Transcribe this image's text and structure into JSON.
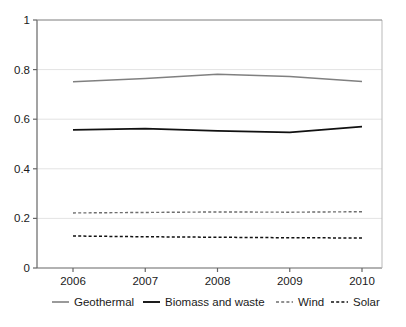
{
  "chart_data": {
    "type": "line",
    "title": "",
    "subtitle": "",
    "xlabel": "",
    "ylabel": "",
    "x": [
      2006,
      2007,
      2008,
      2009,
      2010
    ],
    "categories": [
      "2006",
      "2007",
      "2008",
      "2009",
      "2010"
    ],
    "xtick_labels": [
      "2006",
      "2007",
      "2008",
      "2009",
      "2010"
    ],
    "ytick_labels": [
      "0",
      "0.2",
      "0.4",
      "0.6",
      "0.8",
      "1"
    ],
    "ytick_values": [
      0,
      0.2,
      0.4,
      0.6,
      0.8,
      1
    ],
    "ylim": [
      0,
      1
    ],
    "xlim": [
      2006,
      2010
    ],
    "grid": "horizontal",
    "legend_position": "bottom",
    "series": [
      {
        "name": "Geothermal",
        "values": [
          0.751,
          0.764,
          0.781,
          0.772,
          0.752
        ],
        "color": "#808080",
        "style": "solid",
        "width": 1.4
      },
      {
        "name": "Biomass and waste",
        "values": [
          0.557,
          0.562,
          0.553,
          0.547,
          0.57
        ],
        "color": "#111111",
        "style": "solid",
        "width": 1.7
      },
      {
        "name": "Wind",
        "values": [
          0.222,
          0.224,
          0.226,
          0.225,
          0.227
        ],
        "color": "#6e6e6e",
        "style": "dashed",
        "width": 1.4
      },
      {
        "name": "Solar",
        "values": [
          0.129,
          0.126,
          0.124,
          0.122,
          0.121
        ],
        "color": "#111111",
        "style": "dashed",
        "width": 1.5
      }
    ]
  },
  "axes": {
    "y_axis_name": "value-axis",
    "x_axis_name": "year-axis"
  },
  "legend": {
    "entries": [
      {
        "label": "Geothermal",
        "swatch": "solid-gray"
      },
      {
        "label": "Biomass and waste",
        "swatch": "solid-black"
      },
      {
        "label": "Wind",
        "swatch": "dashed-gray"
      },
      {
        "label": "Solar",
        "swatch": "dashed-black"
      }
    ]
  },
  "colors": {
    "background": "#ffffff",
    "axis": "#666666",
    "grid": "#e3e3e3",
    "text": "#1a1a1a",
    "geothermal": "#808080",
    "biomass": "#111111",
    "wind": "#6e6e6e",
    "solar": "#111111"
  }
}
